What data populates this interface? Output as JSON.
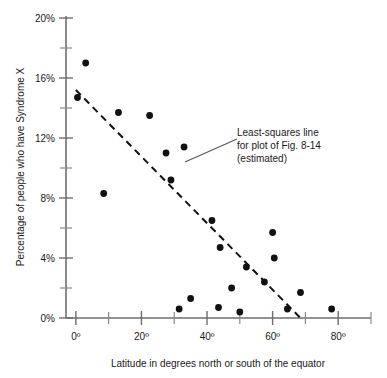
{
  "chart_data": {
    "type": "scatter",
    "title": "",
    "xlabel": "Latitude in degrees north or south of the equator",
    "ylabel": "Percentage of people who have Syndrome X",
    "xlim": [
      -3,
      90
    ],
    "ylim": [
      0,
      20
    ],
    "grid": false,
    "legend": "none",
    "x_ticks_major": [
      "0º",
      "20º",
      "40º",
      "60º",
      "80º"
    ],
    "x_tick_values_major": [
      0,
      20,
      40,
      60,
      80
    ],
    "x_tick_values_minor": [
      10,
      30,
      50,
      70,
      90
    ],
    "y_ticks_major": [
      "0%",
      "4%",
      "8%",
      "12%",
      "16%",
      "20%"
    ],
    "y_tick_values_major": [
      0,
      4,
      8,
      12,
      16,
      20
    ],
    "y_tick_values_minor": [
      2,
      6,
      10,
      14,
      18
    ],
    "points": [
      {
        "x": 0.5,
        "y": 14.7
      },
      {
        "x": 3.0,
        "y": 17.0
      },
      {
        "x": 8.5,
        "y": 8.3
      },
      {
        "x": 13.0,
        "y": 13.7
      },
      {
        "x": 22.5,
        "y": 13.5
      },
      {
        "x": 27.5,
        "y": 11.0
      },
      {
        "x": 29.0,
        "y": 9.2
      },
      {
        "x": 31.5,
        "y": 0.6
      },
      {
        "x": 33.0,
        "y": 11.4
      },
      {
        "x": 35.0,
        "y": 1.3
      },
      {
        "x": 41.5,
        "y": 6.5
      },
      {
        "x": 43.5,
        "y": 0.7
      },
      {
        "x": 44.0,
        "y": 4.7
      },
      {
        "x": 47.5,
        "y": 2.0
      },
      {
        "x": 50.0,
        "y": 0.4
      },
      {
        "x": 52.0,
        "y": 3.4
      },
      {
        "x": 57.5,
        "y": 2.4
      },
      {
        "x": 60.0,
        "y": 5.7
      },
      {
        "x": 60.5,
        "y": 4.0
      },
      {
        "x": 64.5,
        "y": 0.6
      },
      {
        "x": 68.5,
        "y": 1.7
      },
      {
        "x": 78.0,
        "y": 0.6
      }
    ],
    "fit_line": {
      "label": "Least-squares line",
      "x_start": 0.0,
      "y_start": 15.2,
      "x_end": 68.5,
      "y_end": 0.0,
      "style": "dashed"
    },
    "annotation": {
      "line1": "Least-squares line",
      "line2": "for plot of Fig. 8-14",
      "line3": "(estimated)"
    }
  }
}
